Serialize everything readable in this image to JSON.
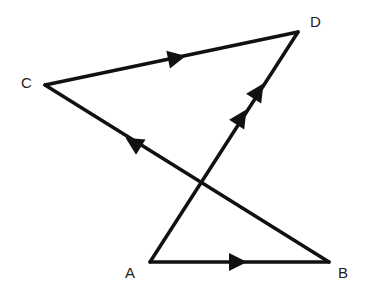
{
  "diagram": {
    "type": "directed-graph",
    "stroke_color": "#111111",
    "background": "#ffffff",
    "vertices": [
      {
        "id": "A",
        "label": "A",
        "x": 150,
        "y": 262
      },
      {
        "id": "B",
        "label": "B",
        "x": 329,
        "y": 262
      },
      {
        "id": "C",
        "label": "C",
        "x": 45,
        "y": 85
      },
      {
        "id": "D",
        "label": "D",
        "x": 298,
        "y": 32
      }
    ],
    "edges": [
      {
        "from": "A",
        "to": "B",
        "arrows": 1
      },
      {
        "from": "B",
        "to": "C",
        "arrows": 1
      },
      {
        "from": "C",
        "to": "D",
        "arrows": 1
      },
      {
        "from": "A",
        "to": "D",
        "arrows": 2
      }
    ],
    "labels": {
      "A": "A",
      "B": "B",
      "C": "C",
      "D": "D"
    }
  }
}
